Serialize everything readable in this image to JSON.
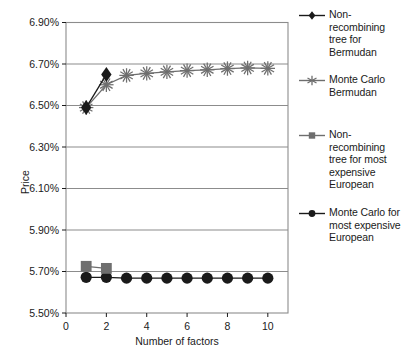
{
  "chart_data": {
    "type": "line",
    "title": "",
    "xlabel": "Number of factors",
    "ylabel": "Price",
    "x": [
      1,
      2,
      3,
      4,
      5,
      6,
      7,
      8,
      9,
      10
    ],
    "xlim": [
      0,
      11
    ],
    "ylim": [
      5.5,
      6.9
    ],
    "xticks": [
      "0",
      "2",
      "4",
      "6",
      "8",
      "10"
    ],
    "xtick_values": [
      0,
      2,
      4,
      6,
      8,
      10
    ],
    "yticks": [
      "5.50%",
      "5.70%",
      "5.90%",
      "6.10%",
      "6.30%",
      "6.50%",
      "6.70%",
      "6.90%"
    ],
    "ytick_values": [
      5.5,
      5.7,
      5.9,
      6.1,
      6.3,
      6.5,
      6.7,
      6.9
    ],
    "grid": "horizontal",
    "legend_position": "right",
    "series": [
      {
        "name": "Non-recombining tree for Bermudan",
        "marker": "diamond",
        "color": "#1a1a1a",
        "x": [
          1,
          2
        ],
        "values": [
          6.49,
          6.65
        ]
      },
      {
        "name": "Monte Carlo Bermudan",
        "marker": "asterisk",
        "color": "#6e6e6e",
        "x": [
          1,
          2,
          3,
          4,
          5,
          6,
          7,
          8,
          9,
          10
        ],
        "values": [
          6.49,
          6.6,
          6.645,
          6.655,
          6.662,
          6.668,
          6.672,
          6.678,
          6.681,
          6.679
        ]
      },
      {
        "name": "Non-recombining tree for most expensive European",
        "marker": "square",
        "color": "#6e6e6e",
        "x": [
          1,
          2
        ],
        "values": [
          5.725,
          5.715
        ]
      },
      {
        "name": "Monte Carlo for most expensive European",
        "marker": "circle",
        "color": "#1a1a1a",
        "x": [
          1,
          2,
          3,
          4,
          5,
          6,
          7,
          8,
          9,
          10
        ],
        "values": [
          5.672,
          5.672,
          5.668,
          5.668,
          5.668,
          5.668,
          5.668,
          5.668,
          5.668,
          5.668
        ]
      }
    ]
  },
  "legend": {
    "entries": [
      {
        "label": "Non-recombining tree for Bermudan",
        "marker": "diamond-marker",
        "color": "#1a1a1a"
      },
      {
        "label": "Monte Carlo Bermudan",
        "marker": "asterisk-marker",
        "color": "#6e6e6e"
      },
      {
        "label": "Non-recombining tree for most expensive European",
        "marker": "square-marker",
        "color": "#6e6e6e"
      },
      {
        "label": "Monte Carlo for most expensive European",
        "marker": "circle-marker",
        "color": "#1a1a1a"
      }
    ]
  },
  "axes": {
    "y_title": "Price",
    "x_title": "Number of factors"
  }
}
